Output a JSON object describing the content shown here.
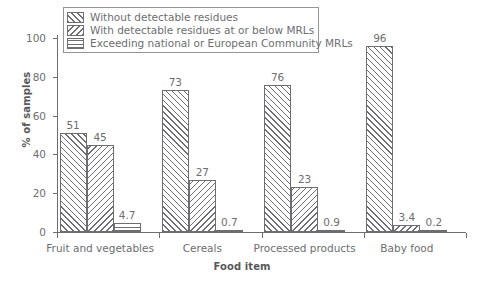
{
  "chart_data": {
    "type": "bar",
    "title": "",
    "xlabel": "Food item",
    "ylabel": "% of samples",
    "ylim": [
      0,
      100
    ],
    "yticks": [
      0,
      20,
      40,
      60,
      80,
      100
    ],
    "ytick_labels": [
      "0",
      "20",
      "40",
      "60",
      "80",
      "100"
    ],
    "grid": false,
    "legend_position": "top-left",
    "categories": [
      "Fruit and vegetables",
      "Cereals",
      "Processed products",
      "Baby food"
    ],
    "series": [
      {
        "name": "Without detectable residues",
        "pattern": "forward-slash-hatch",
        "values": [
          51,
          73,
          76,
          96
        ],
        "value_labels": [
          "51",
          "73",
          "76",
          "96"
        ]
      },
      {
        "name": "With detectable residues at or below MRLs",
        "pattern": "back-slash-hatch",
        "values": [
          45,
          27,
          23,
          3.4
        ],
        "value_labels": [
          "45",
          "27",
          "23",
          "3.4"
        ]
      },
      {
        "name": "Exceeding national or European Community MRLs",
        "pattern": "horizontal-line-hatch",
        "values": [
          4.7,
          0.7,
          0.9,
          0.2
        ],
        "value_labels": [
          "4.7",
          "0.7",
          "0.9",
          "0.2"
        ]
      }
    ]
  },
  "colors": {
    "ink": "#6d6e71",
    "ink_dark": "#58595b",
    "background": "#ffffff",
    "legend_border": "#939598"
  }
}
